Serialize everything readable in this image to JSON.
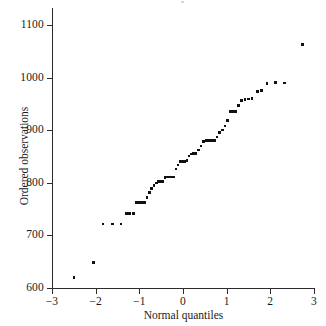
{
  "chart_data": {
    "type": "scatter",
    "title": "",
    "xlabel": "Normal quantiles",
    "ylabel": "Ordered observations",
    "xlim": [
      -3,
      3
    ],
    "ylim": [
      600,
      1100
    ],
    "xticks": [
      -3,
      -2,
      -1,
      0,
      1,
      2,
      3
    ],
    "xticklabels": [
      "−3",
      "−2",
      "−1",
      "0",
      "1",
      "2",
      "3"
    ],
    "yticks": [
      600,
      700,
      800,
      900,
      1000,
      1100
    ],
    "yticklabels": [
      "600",
      "700",
      "800",
      "900",
      "1000",
      "1100"
    ],
    "grid": false,
    "legend": null,
    "marker": "square",
    "marker_color": "#111111",
    "axis_color": "#2b2b2b",
    "background": "#ffffff",
    "points": [
      {
        "x": -2.5,
        "y": 620
      },
      {
        "x": -2.05,
        "y": 648
      },
      {
        "x": -1.83,
        "y": 722
      },
      {
        "x": -1.62,
        "y": 722
      },
      {
        "x": -1.42,
        "y": 722
      },
      {
        "x": -1.3,
        "y": 742
      },
      {
        "x": -1.22,
        "y": 742
      },
      {
        "x": -1.13,
        "y": 742
      },
      {
        "x": -1.06,
        "y": 763
      },
      {
        "x": -1.0,
        "y": 763
      },
      {
        "x": -0.94,
        "y": 763
      },
      {
        "x": -0.88,
        "y": 763
      },
      {
        "x": -0.82,
        "y": 772
      },
      {
        "x": -0.77,
        "y": 782
      },
      {
        "x": -0.72,
        "y": 789
      },
      {
        "x": -0.66,
        "y": 795
      },
      {
        "x": -0.61,
        "y": 800
      },
      {
        "x": -0.56,
        "y": 802
      },
      {
        "x": -0.51,
        "y": 802
      },
      {
        "x": -0.46,
        "y": 803
      },
      {
        "x": -0.41,
        "y": 810
      },
      {
        "x": -0.36,
        "y": 811
      },
      {
        "x": -0.31,
        "y": 811
      },
      {
        "x": -0.26,
        "y": 811
      },
      {
        "x": -0.21,
        "y": 811
      },
      {
        "x": -0.16,
        "y": 826
      },
      {
        "x": -0.11,
        "y": 834
      },
      {
        "x": -0.06,
        "y": 840
      },
      {
        "x": -0.01,
        "y": 841
      },
      {
        "x": 0.04,
        "y": 841
      },
      {
        "x": 0.09,
        "y": 842
      },
      {
        "x": 0.14,
        "y": 851
      },
      {
        "x": 0.19,
        "y": 855
      },
      {
        "x": 0.24,
        "y": 856
      },
      {
        "x": 0.29,
        "y": 856
      },
      {
        "x": 0.35,
        "y": 862
      },
      {
        "x": 0.41,
        "y": 870
      },
      {
        "x": 0.47,
        "y": 878
      },
      {
        "x": 0.53,
        "y": 880
      },
      {
        "x": 0.59,
        "y": 880
      },
      {
        "x": 0.65,
        "y": 880
      },
      {
        "x": 0.72,
        "y": 880
      },
      {
        "x": 0.78,
        "y": 887
      },
      {
        "x": 0.84,
        "y": 896
      },
      {
        "x": 0.9,
        "y": 900
      },
      {
        "x": 0.96,
        "y": 908
      },
      {
        "x": 1.02,
        "y": 918
      },
      {
        "x": 1.08,
        "y": 935
      },
      {
        "x": 1.14,
        "y": 936
      },
      {
        "x": 1.2,
        "y": 936
      },
      {
        "x": 1.27,
        "y": 947
      },
      {
        "x": 1.34,
        "y": 956
      },
      {
        "x": 1.42,
        "y": 958
      },
      {
        "x": 1.5,
        "y": 959
      },
      {
        "x": 1.58,
        "y": 960
      },
      {
        "x": 1.7,
        "y": 974
      },
      {
        "x": 1.8,
        "y": 975
      },
      {
        "x": 1.92,
        "y": 989
      },
      {
        "x": 2.12,
        "y": 991
      },
      {
        "x": 2.33,
        "y": 990
      },
      {
        "x": 2.74,
        "y": 1063
      }
    ]
  }
}
